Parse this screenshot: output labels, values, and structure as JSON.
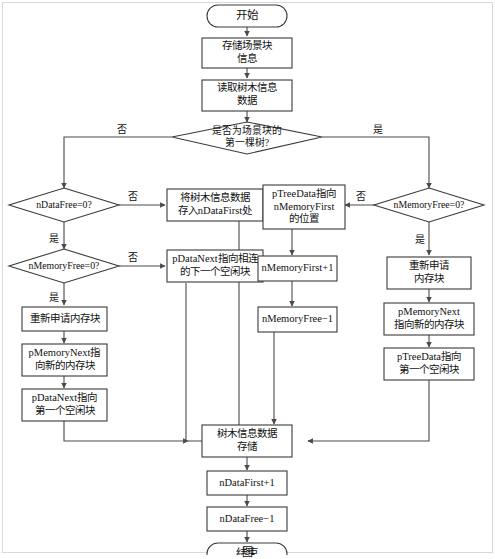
{
  "diagram": {
    "caption": "图",
    "colors": {
      "stroke": "#3a3a3a",
      "connector": "#4a4a4a",
      "fill": "#ffffff",
      "text": "#111111",
      "frame": "#d8d8d8"
    },
    "nodes": [
      {
        "id": "start",
        "shape": "terminator",
        "lines": [
          "开始"
        ]
      },
      {
        "id": "store-scene",
        "shape": "process",
        "lines": [
          "存储场景块",
          "信息"
        ]
      },
      {
        "id": "read-tree",
        "shape": "process",
        "lines": [
          "读取树木信息",
          "数据"
        ]
      },
      {
        "id": "is-first-tree",
        "shape": "decision",
        "lines": [
          "是否为场景块的",
          "第一棵树?"
        ]
      },
      {
        "id": "ndatafree-zero",
        "shape": "decision",
        "lines": [
          "nDataFree=0?"
        ]
      },
      {
        "id": "save-ndatafirst",
        "shape": "process",
        "lines": [
          "将树木信息数据",
          "存入nDataFirst处"
        ]
      },
      {
        "id": "nmemfree-zero-l",
        "shape": "decision",
        "lines": [
          "nMemoryFree=0?"
        ]
      },
      {
        "id": "pdatanext-next",
        "shape": "process",
        "lines": [
          "pDataNext指向相连",
          "的下一个空闲块"
        ]
      },
      {
        "id": "realloc-mem-l",
        "shape": "process",
        "lines": [
          "重新申请内存块"
        ]
      },
      {
        "id": "pmemnext-new-l",
        "shape": "process",
        "lines": [
          "pMemoryNext指",
          "向新的内存块"
        ]
      },
      {
        "id": "pdatanext-first",
        "shape": "process",
        "lines": [
          "pDataNext指向",
          "第一个空闲块"
        ]
      },
      {
        "id": "ptreedata-pos",
        "shape": "process",
        "lines": [
          "pTreeData指向",
          "nMemoryFirst",
          "的位置"
        ]
      },
      {
        "id": "nmemfirst-plus",
        "shape": "process",
        "lines": [
          "nMemoryFirst+1"
        ]
      },
      {
        "id": "nmemfree-minus",
        "shape": "process",
        "lines": [
          "nMemoryFree−1"
        ]
      },
      {
        "id": "nmemfree-zero-r",
        "shape": "decision",
        "lines": [
          "nMemoryFree=0?"
        ]
      },
      {
        "id": "realloc-mem-r",
        "shape": "process",
        "lines": [
          "重新申请",
          "内存块"
        ]
      },
      {
        "id": "pmemnext-new-r",
        "shape": "process",
        "lines": [
          "pMemoryNext",
          "指向新的内存块"
        ]
      },
      {
        "id": "ptreedata-first",
        "shape": "process",
        "lines": [
          "pTreeData指向",
          "第一个空闲块"
        ]
      },
      {
        "id": "tree-store",
        "shape": "process",
        "lines": [
          "树木信息数据",
          "存储"
        ]
      },
      {
        "id": "ndatafirst-plus",
        "shape": "process",
        "lines": [
          "nDataFirst+1"
        ]
      },
      {
        "id": "ndatafree-minus",
        "shape": "process",
        "lines": [
          "nDataFree−1"
        ]
      },
      {
        "id": "end",
        "shape": "terminator",
        "lines": [
          "结束"
        ]
      }
    ],
    "edge_labels": [
      {
        "id": "first-tree-no",
        "text": "否"
      },
      {
        "id": "first-tree-yes",
        "text": "是"
      },
      {
        "id": "ndatafree-no",
        "text": "否"
      },
      {
        "id": "ndatafree-yes",
        "text": "是"
      },
      {
        "id": "nmemfree-l-no",
        "text": "否"
      },
      {
        "id": "nmemfree-l-yes",
        "text": "是"
      },
      {
        "id": "nmemfree-r-no",
        "text": "否"
      },
      {
        "id": "nmemfree-r-yes",
        "text": "是"
      }
    ]
  }
}
